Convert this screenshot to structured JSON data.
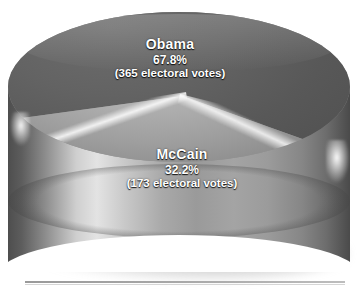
{
  "canvas": {
    "width": 361,
    "height": 296,
    "background": "#ffffff"
  },
  "chart_data": {
    "type": "pie",
    "title": "",
    "subtitle": "",
    "xlabel": "",
    "ylabel": "",
    "legend_position": "none",
    "grid": false,
    "style": "3d-cylinder-grayscale",
    "total_electoral_votes": 538,
    "categories": [
      "Obama",
      "McCain"
    ],
    "values": [
      67.8,
      32.2
    ],
    "value_unit": "%",
    "slices": [
      {
        "label": "Obama",
        "percent": "67.8%",
        "percent_value": 67.8,
        "detail": "(365 electoral votes)",
        "electoral_votes": 365,
        "color": "#5a5a5a",
        "position": "back"
      },
      {
        "label": "McCain",
        "percent": "32.2%",
        "percent_value": 32.2,
        "detail": "(173 electoral votes)",
        "electoral_votes": 173,
        "color": "#9e9e9e",
        "position": "front"
      }
    ],
    "annotations": [
      "Obama 67.8% (365 electoral votes)",
      "McCain 32.2% (173 electoral votes)"
    ]
  },
  "labels": {
    "obama": {
      "name": "Obama",
      "percent": "67.8%",
      "detail": "(365 electoral votes)"
    },
    "mccain": {
      "name": "McCain",
      "percent": "32.2%",
      "detail": "(173 electoral votes)"
    }
  },
  "colors": {
    "obama_slice": "#5a5a5a",
    "mccain_slice": "#9e9e9e",
    "label_text": "#ffffff",
    "rule": "#a8a8a8",
    "background": "#ffffff"
  }
}
